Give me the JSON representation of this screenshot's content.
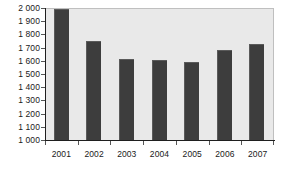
{
  "chart_data": {
    "type": "bar",
    "title": "",
    "subtitle": "",
    "xlabel": "",
    "ylabel": "",
    "categories": [
      "2001",
      "2002",
      "2003",
      "2004",
      "2005",
      "2006",
      "2007"
    ],
    "values": [
      1990,
      1748,
      1612,
      1605,
      1593,
      1681,
      1730
    ],
    "series": [
      {
        "name": "",
        "values": [
          1990,
          1748,
          1612,
          1605,
          1593,
          1681,
          1730
        ]
      }
    ],
    "ylim": [
      1000,
      2000
    ],
    "ytick_step": 100,
    "ytick_labels": [
      "2 000",
      "1 900",
      "1 800",
      "1 700",
      "1 600",
      "1 500",
      "1 400",
      "1 300",
      "1 200",
      "1 100",
      "1 000"
    ],
    "ytick_values": [
      2000,
      1900,
      1800,
      1700,
      1600,
      1500,
      1400,
      1300,
      1200,
      1100,
      1000
    ],
    "grid": false,
    "legend": false,
    "legend_position": "none",
    "colors": {
      "bar": "#3d3d3d",
      "bar_edge": "#5a5a5a",
      "plot_background": "#e9e9e9",
      "page_background": "#ffffff",
      "axis": "#1f1f1f",
      "tick": "#555555",
      "text": "#1a1a1a",
      "plot_border": "#bfbfbf"
    }
  }
}
